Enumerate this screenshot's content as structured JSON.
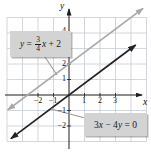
{
  "figure": {
    "axis_labels": {
      "x": "x",
      "y": "y"
    }
  },
  "equations": {
    "line1": {
      "lhs": "y",
      "rel": " = ",
      "frac_num": "3",
      "frac_den": "4",
      "var": "x",
      "op": " + ",
      "const": "2"
    },
    "line2": {
      "tokens": [
        {
          "t": "3"
        },
        {
          "t": "x"
        },
        {
          "t": " − 4"
        },
        {
          "t": "y"
        },
        {
          "t": " = "
        },
        {
          "t": "0"
        }
      ]
    }
  },
  "chart_data": {
    "type": "line",
    "title": "",
    "xlabel": "x",
    "ylabel": "y",
    "xlim": [
      -4,
      5
    ],
    "ylim": [
      -3.5,
      5.5
    ],
    "grid": true,
    "x_tick_labels": [
      "−2",
      "−1",
      "1",
      "2",
      "3"
    ],
    "y_tick_labels": [
      "4",
      "2",
      "1",
      "−1",
      "−2"
    ],
    "x_tick_values": [
      -2,
      -1,
      1,
      2,
      3
    ],
    "y_tick_values": [
      -2,
      -1,
      1,
      2,
      3,
      4
    ],
    "series": [
      {
        "name": "y = 3/4 x + 2",
        "equation_label": "y = 3/4 x + 2",
        "slope": 0.75,
        "y_intercept": 2,
        "color": "#a8a8a8",
        "x_range": [
          -3.95,
          4.78
        ],
        "x": [
          -4,
          0,
          4
        ],
        "y": [
          -1,
          2,
          5
        ]
      },
      {
        "name": "3x − 4y = 0",
        "equation_label": "3x − 4y = 0",
        "slope": 0.75,
        "y_intercept": 0,
        "color": "#222222",
        "x_range": [
          -3.75,
          4.3
        ],
        "x": [
          -4,
          0,
          4
        ],
        "y": [
          -3,
          0,
          3
        ]
      }
    ]
  }
}
